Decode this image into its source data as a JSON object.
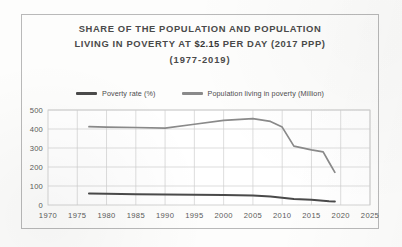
{
  "document": {
    "border_color": "#b9b9b9",
    "background": "#fdfdfc"
  },
  "title": {
    "line1": "SHARE OF THE POPULATION AND POPULATION",
    "line2_pre": "LIVING IN POVERTY AT ",
    "line2_amount": "$2.15",
    "line2_post": " PER DAY (2017 PPP)",
    "line3": "(1977-2019)"
  },
  "legend": {
    "position": "top",
    "items": [
      {
        "label": "Poverty rate (%)",
        "color": "#4a4a4a"
      },
      {
        "label": "Population living in poverty (Million)",
        "color": "#8a8a8a"
      }
    ]
  },
  "chart_data": {
    "type": "line",
    "title": "SHARE OF THE POPULATION AND POPULATION LIVING IN POVERTY AT $2.15 PER DAY (2017 PPP) (1977-2019)",
    "xlabel": "",
    "ylabel": "",
    "grid": true,
    "legend_position": "top",
    "xlim": [
      1970,
      2025
    ],
    "ylim": [
      0,
      500
    ],
    "xticks": [
      1970,
      1975,
      1980,
      1985,
      1990,
      1995,
      2000,
      2005,
      2010,
      2015,
      2020,
      2025
    ],
    "yticks": [
      0,
      100,
      200,
      300,
      400,
      500
    ],
    "x": [
      1977,
      1980,
      1985,
      1990,
      1995,
      2000,
      2005,
      2008,
      2010,
      2012,
      2015,
      2017,
      2018,
      2019
    ],
    "series": [
      {
        "name": "Poverty rate (%)",
        "color": "#4a4a4a",
        "unit": "%",
        "values": [
          60,
          59,
          57,
          55,
          54,
          52,
          50,
          45,
          38,
          32,
          27,
          22,
          20,
          19
        ]
      },
      {
        "name": "Population living in poverty (Million)",
        "color": "#8a8a8a",
        "unit": "Million",
        "values": [
          412,
          410,
          408,
          405,
          425,
          445,
          455,
          440,
          410,
          310,
          290,
          280,
          225,
          172
        ]
      }
    ]
  },
  "axis": {
    "y_tick_labels": [
      "500",
      "400",
      "300",
      "200",
      "100",
      "0"
    ],
    "x_tick_labels": [
      "1970",
      "1975",
      "1980",
      "1985",
      "1990",
      "1995",
      "2000",
      "2005",
      "2010",
      "2015",
      "2020",
      "2025"
    ]
  }
}
